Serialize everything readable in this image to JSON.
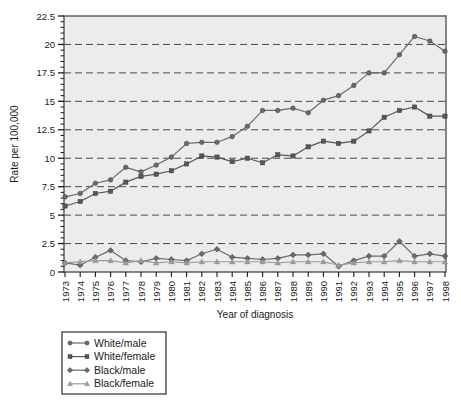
{
  "chart_data": {
    "type": "line",
    "title": "",
    "xlabel": "Year of diagnosis",
    "ylabel": "Rate per 100,000",
    "xlim": [
      1973,
      1998
    ],
    "ylim": [
      0,
      22.5
    ],
    "yticks": [
      0,
      2.5,
      5,
      7.5,
      10,
      12.5,
      15,
      17.5,
      20,
      22.5
    ],
    "ytick_labels": [
      "0",
      "2.5",
      "5",
      "7.5",
      "10",
      "12.5",
      "15",
      "17.5",
      "20",
      "22.5"
    ],
    "grid": "horizontal-dashed",
    "legend_position": "below-left",
    "categories": [
      1973,
      1974,
      1975,
      1976,
      1977,
      1978,
      1979,
      1980,
      1981,
      1982,
      1983,
      1984,
      1985,
      1986,
      1987,
      1988,
      1989,
      1990,
      1991,
      1992,
      1993,
      1994,
      1995,
      1996,
      1997,
      1998
    ],
    "xtick_labels": [
      "1973",
      "1974",
      "1975",
      "1976",
      "1977",
      "1978",
      "1979",
      "1980",
      "1981",
      "1982",
      "1983",
      "1984",
      "1985",
      "1986",
      "1987",
      "1988",
      "1989",
      "1990",
      "1991",
      "1992",
      "1993",
      "1994",
      "1995",
      "1996",
      "1997",
      "1998"
    ],
    "series": [
      {
        "name": "White/male",
        "marker": "circle",
        "color": "#6b6b6b",
        "values": [
          6.6,
          6.9,
          7.8,
          8.1,
          9.2,
          8.8,
          9.4,
          10.1,
          11.3,
          11.4,
          11.4,
          11.9,
          12.8,
          14.2,
          14.2,
          14.4,
          14.0,
          15.1,
          15.5,
          16.4,
          17.5,
          17.5,
          19.1,
          20.7,
          20.3,
          19.4
        ]
      },
      {
        "name": "White/female",
        "marker": "square",
        "color": "#575757",
        "values": [
          5.8,
          6.2,
          6.9,
          7.1,
          7.9,
          8.4,
          8.6,
          8.9,
          9.5,
          10.2,
          10.1,
          9.7,
          10.0,
          9.6,
          10.3,
          10.2,
          11.0,
          11.5,
          11.3,
          11.5,
          12.4,
          13.6,
          14.2,
          14.5,
          13.7,
          13.7
        ]
      },
      {
        "name": "Black/male",
        "marker": "diamond",
        "color": "#6b6b6b",
        "values": [
          0.8,
          0.6,
          1.3,
          1.9,
          1.0,
          0.9,
          1.2,
          1.1,
          1.0,
          1.6,
          2.0,
          1.3,
          1.2,
          1.1,
          1.2,
          1.5,
          1.5,
          1.6,
          0.5,
          1.0,
          1.4,
          1.4,
          2.7,
          1.4,
          1.6,
          1.4
        ]
      },
      {
        "name": "Black/female",
        "marker": "triangle",
        "color": "#9b9b9b",
        "values": [
          0.8,
          0.9,
          1.0,
          1.0,
          0.8,
          1.0,
          0.8,
          0.9,
          0.8,
          0.9,
          0.9,
          0.9,
          0.9,
          0.9,
          0.8,
          0.9,
          0.9,
          0.9,
          0.6,
          0.8,
          0.9,
          0.9,
          1.0,
          0.9,
          0.9,
          0.9
        ]
      }
    ]
  },
  "legend": {
    "items": [
      {
        "label": "White/male",
        "marker": "circle",
        "color": "#6b6b6b"
      },
      {
        "label": "White/female",
        "marker": "square",
        "color": "#575757"
      },
      {
        "label": "Black/male",
        "marker": "diamond",
        "color": "#6b6b6b"
      },
      {
        "label": "Black/female",
        "marker": "triangle",
        "color": "#9b9b9b"
      }
    ]
  },
  "colors": {
    "plot_background": "#ececec",
    "plot_border": "#555555",
    "gridline": "#4a4a4a",
    "axis": "#1a1a1a",
    "page_background": "#ffffff"
  }
}
